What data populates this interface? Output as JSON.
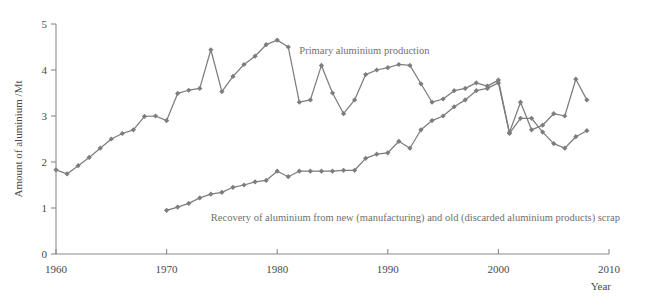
{
  "chart_data": {
    "type": "line",
    "title": "",
    "xlabel": "Year",
    "ylabel": "Amount of aluminium /Mt",
    "xlim": [
      1960,
      2010
    ],
    "ylim": [
      0,
      5
    ],
    "xticks": [
      1960,
      1970,
      1980,
      1990,
      2000,
      2010
    ],
    "yticks": [
      0,
      1,
      2,
      3,
      4,
      5
    ],
    "grid": false,
    "legend_position": "inline-annotations",
    "marker": "diamond",
    "series_color": "#7d7d7d",
    "series": [
      {
        "name": "Primary aluminium production",
        "label_x": 1982,
        "label_y": 4.35,
        "x": [
          1960,
          1961,
          1962,
          1963,
          1964,
          1965,
          1966,
          1967,
          1968,
          1969,
          1970,
          1971,
          1972,
          1973,
          1974,
          1975,
          1976,
          1977,
          1978,
          1979,
          1980,
          1981,
          1982,
          1983,
          1984,
          1985,
          1986,
          1987,
          1988,
          1989,
          1990,
          1991,
          1992,
          1993,
          1994,
          1995,
          1996,
          1997,
          1998,
          1999,
          2000,
          2001,
          2002,
          2003,
          2004,
          2005,
          2006,
          2007,
          2008
        ],
        "values": [
          1.83,
          1.74,
          1.92,
          2.1,
          2.3,
          2.5,
          2.62,
          2.7,
          2.99,
          3.0,
          2.9,
          3.49,
          3.56,
          3.6,
          4.44,
          3.53,
          3.86,
          4.12,
          4.3,
          4.55,
          4.65,
          4.5,
          3.3,
          3.35,
          4.1,
          3.5,
          3.05,
          3.35,
          3.9,
          4.0,
          4.05,
          4.12,
          4.1,
          3.7,
          3.3,
          3.37,
          3.55,
          3.6,
          3.72,
          3.65,
          3.78,
          2.64,
          3.3,
          2.7,
          2.8,
          3.05,
          3.0,
          3.8,
          3.35
        ]
      },
      {
        "name": "Recovery of aluminium from new (manufacturing) and old (discarded aluminium products) scrap",
        "label_x": 1974,
        "label_y": 0.72,
        "x": [
          1970,
          1971,
          1972,
          1973,
          1974,
          1975,
          1976,
          1977,
          1978,
          1979,
          1980,
          1981,
          1982,
          1983,
          1984,
          1985,
          1986,
          1987,
          1988,
          1989,
          1990,
          1991,
          1992,
          1993,
          1994,
          1995,
          1996,
          1997,
          1998,
          1999,
          2000,
          2001,
          2002,
          2003,
          2004,
          2005,
          2006,
          2007,
          2008
        ],
        "values": [
          0.95,
          1.02,
          1.1,
          1.22,
          1.3,
          1.34,
          1.45,
          1.5,
          1.57,
          1.6,
          1.8,
          1.68,
          1.8,
          1.8,
          1.8,
          1.8,
          1.82,
          1.82,
          2.08,
          2.17,
          2.2,
          2.45,
          2.3,
          2.7,
          2.9,
          3.0,
          3.2,
          3.35,
          3.55,
          3.6,
          3.72,
          2.62,
          2.95,
          2.95,
          2.65,
          2.4,
          2.3,
          2.55,
          2.68
        ]
      }
    ]
  }
}
